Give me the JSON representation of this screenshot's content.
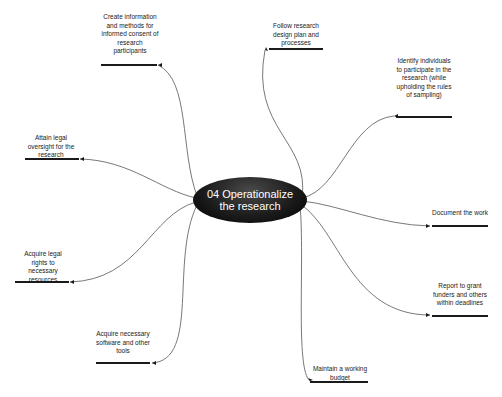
{
  "diagram": {
    "type": "mind-map",
    "center": {
      "label": "04 Operationalize the research",
      "fill": "#111111",
      "text_color": "#ffffff"
    },
    "branches": [
      {
        "id": "consent",
        "label": "Create information and methods for informed consent of research participants"
      },
      {
        "id": "follow",
        "label": "Follow research design plan and processes"
      },
      {
        "id": "identify",
        "label": "Identify individuals to participate in the research (while upholding the rules of sampling)"
      },
      {
        "id": "oversight",
        "label": "Attain legal oversight for the research"
      },
      {
        "id": "document",
        "label": "Document the work"
      },
      {
        "id": "rights",
        "label": "Acquire legal rights to necessary resources"
      },
      {
        "id": "report",
        "label": "Report to grant funders and others within deadlines"
      },
      {
        "id": "software",
        "label": "Acquire necessary software and other tools"
      },
      {
        "id": "budget",
        "label": "Maintain a working budget"
      }
    ],
    "line_color": "#555555",
    "bar_color": "#1a1a1a"
  }
}
